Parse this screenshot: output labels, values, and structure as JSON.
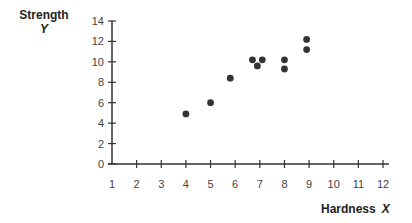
{
  "chart_data": {
    "type": "scatter",
    "title": "",
    "xlabel": "Hardness",
    "xlabel_var": "X",
    "ylabel": "Strength",
    "ylabel_var": "Y",
    "xlim": [
      1,
      12
    ],
    "ylim": [
      0,
      14
    ],
    "x_ticks": [
      1,
      2,
      3,
      4,
      5,
      6,
      7,
      8,
      9,
      10,
      11,
      12
    ],
    "y_ticks": [
      0,
      2,
      4,
      6,
      8,
      10,
      12,
      14
    ],
    "grid": false,
    "legend": null,
    "points": [
      {
        "x": 4.0,
        "y": 4.9
      },
      {
        "x": 5.0,
        "y": 6.0
      },
      {
        "x": 5.8,
        "y": 8.4
      },
      {
        "x": 6.7,
        "y": 10.2
      },
      {
        "x": 6.9,
        "y": 9.6
      },
      {
        "x": 7.1,
        "y": 10.2
      },
      {
        "x": 8.0,
        "y": 10.2
      },
      {
        "x": 8.0,
        "y": 9.3
      },
      {
        "x": 8.9,
        "y": 12.2
      },
      {
        "x": 8.9,
        "y": 11.2
      }
    ],
    "marker_color": "#333333",
    "axis_color": "#333333"
  }
}
